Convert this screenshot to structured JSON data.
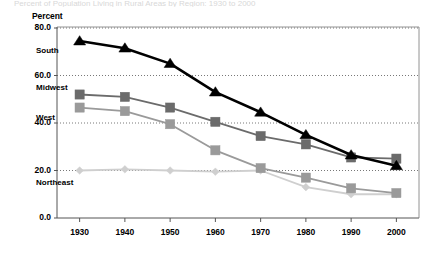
{
  "page": {
    "cut_title": "Percent of Population Living in Rural Areas by Region: 1930 to 2000"
  },
  "chart_data": {
    "type": "line",
    "title": "",
    "xlabel": "",
    "ylabel": "Percent",
    "categories": [
      "1930",
      "1940",
      "1950",
      "1960",
      "1970",
      "1980",
      "1990",
      "2000"
    ],
    "x": [
      1930,
      1940,
      1950,
      1960,
      1970,
      1980,
      1990,
      2000
    ],
    "xlim": [
      1925,
      2005
    ],
    "ylim": [
      0.0,
      80.0
    ],
    "yticks": [
      "0.0",
      "20.0",
      "40.0",
      "60.0",
      "80.0"
    ],
    "ytick_values": [
      0.0,
      20.0,
      40.0,
      60.0,
      80.0
    ],
    "grid": "horizontal-dotted",
    "legend_position": "inline-labels",
    "series": [
      {
        "name": "South",
        "color": "#000000",
        "marker": "triangle",
        "values": [
          74.5,
          71.5,
          65.0,
          53.0,
          44.5,
          35.0,
          26.5,
          22.0
        ]
      },
      {
        "name": "Midwest",
        "color": "#6b6b6b",
        "marker": "square",
        "values": [
          52.0,
          51.0,
          46.5,
          40.5,
          34.5,
          31.0,
          25.5,
          25.0
        ]
      },
      {
        "name": "West",
        "color": "#9a9a9a",
        "marker": "square",
        "values": [
          46.5,
          45.0,
          39.5,
          28.5,
          21.0,
          17.0,
          12.5,
          10.5
        ]
      },
      {
        "name": "Northeast",
        "color": "#cfcfcf",
        "marker": "diamond",
        "values": [
          20.0,
          20.5,
          20.0,
          19.5,
          20.0,
          13.0,
          10.0,
          10.0
        ]
      }
    ]
  }
}
